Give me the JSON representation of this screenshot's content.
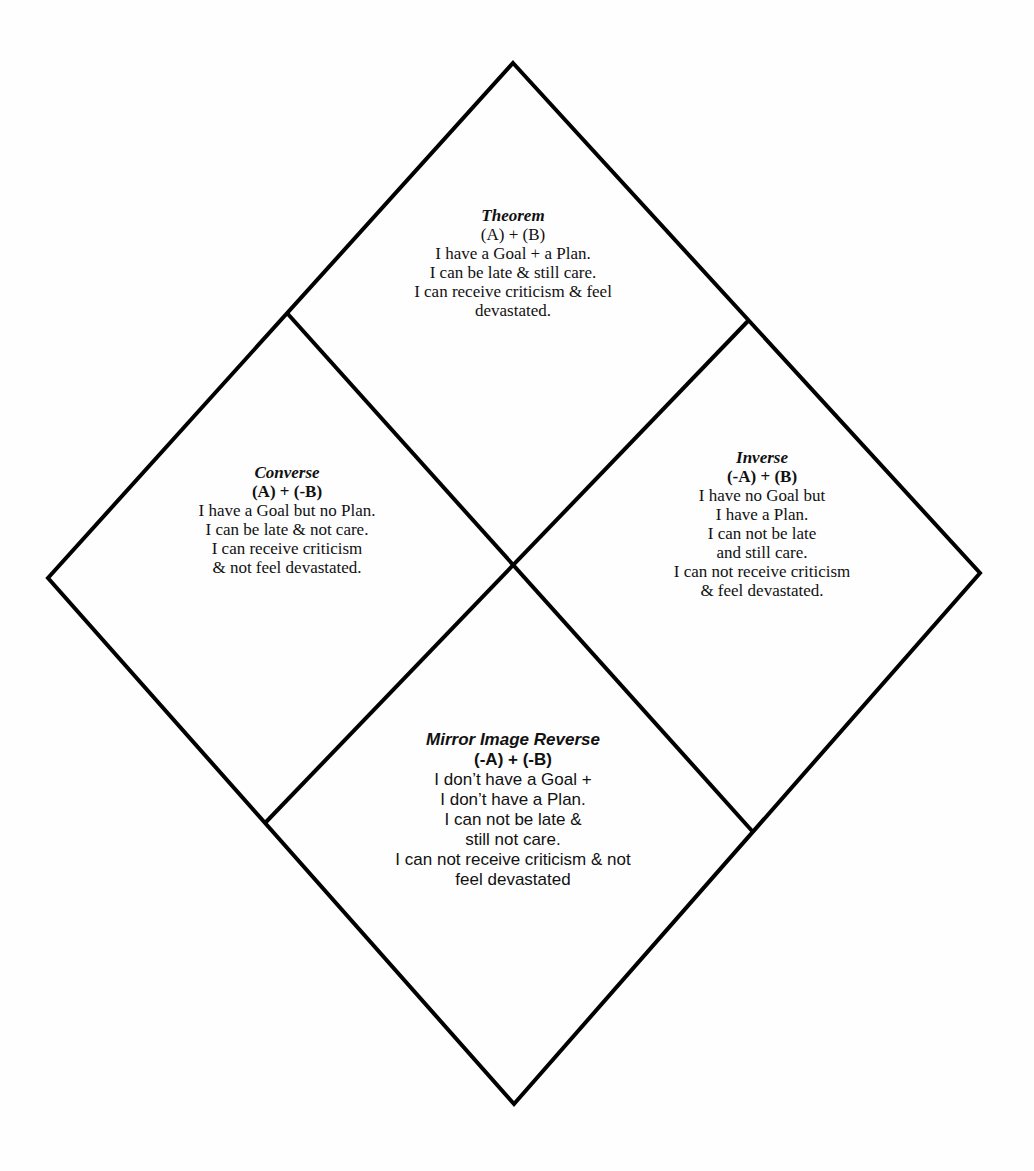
{
  "diagram": {
    "type": "logic-square-diamond",
    "stroke_color": "#000000",
    "background_color": "#ffffff",
    "text_color": "#111111",
    "outer_vertices": {
      "top": [
        513,
        63
      ],
      "right": [
        980,
        573
      ],
      "bottom": [
        514,
        1104
      ],
      "left": [
        48,
        578
      ]
    },
    "center": [
      513,
      564
    ]
  },
  "quadrants": {
    "top": {
      "title": "Theorem",
      "formula": "(A) + (B)",
      "lines": [
        "I have a Goal + a Plan.",
        "I can be late & still care.",
        "I can receive criticism & feel",
        "devastated."
      ]
    },
    "left": {
      "title": "Converse",
      "formula": "(A) + (-B)",
      "lines": [
        "I have a Goal but no Plan.",
        "I can be late & not care.",
        "I can receive criticism",
        "& not feel devastated."
      ]
    },
    "right": {
      "title": "Inverse",
      "formula": "(-A) + (B)",
      "lines": [
        "I have no Goal but",
        "I have a Plan.",
        "I can not be late",
        "and still care.",
        "I can not receive criticism",
        "& feel devastated."
      ]
    },
    "bottom": {
      "title": "Mirror Image Reverse",
      "formula": "(-A) + (-B)",
      "lines": [
        "I don’t have a Goal +",
        "I don’t have a Plan.",
        "I can not be late &",
        "still not care.",
        "I can not receive criticism & not",
        "feel devastated"
      ]
    }
  }
}
